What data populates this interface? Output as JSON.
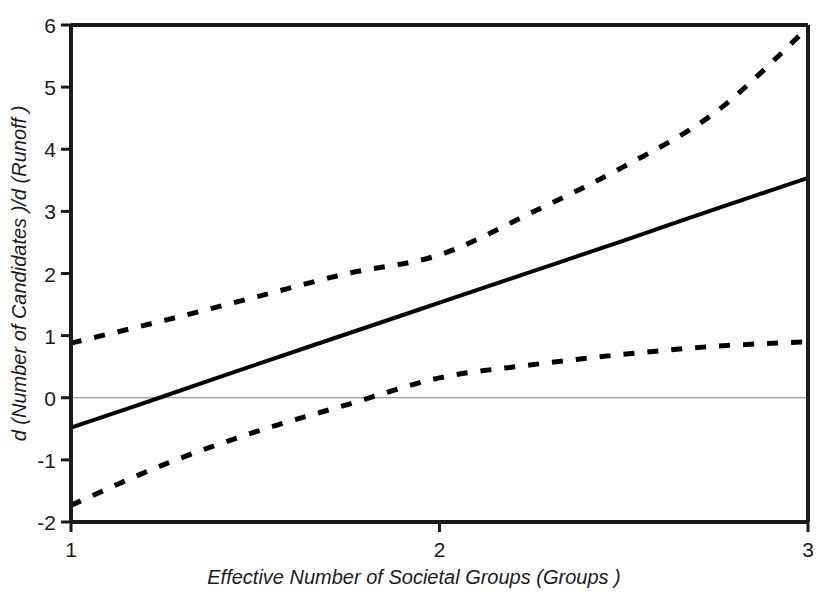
{
  "chart_data": {
    "type": "line",
    "title": "",
    "subtitle": "",
    "xlabel": "Effective Number of Societal Groups  (Groups )",
    "ylabel": "d (Number of Candidates )/d (Runoff )",
    "xlim": [
      1,
      3
    ],
    "ylim": [
      -2,
      6
    ],
    "xticks": [
      1,
      2,
      3
    ],
    "xtick_labels": [
      "1",
      "2",
      "3"
    ],
    "yticks": [
      -2,
      -1,
      0,
      1,
      2,
      3,
      4,
      5,
      6
    ],
    "ytick_labels": [
      "-2",
      "-1",
      "0",
      "1",
      "2",
      "3",
      "4",
      "5",
      "6"
    ],
    "grid": false,
    "legend": null,
    "reference_lines": [
      {
        "name": "zero-line",
        "orientation": "horizontal",
        "y": 0,
        "color": "#808080",
        "style": "solid",
        "width": 1
      }
    ],
    "series": [
      {
        "name": "Marginal Effect",
        "style": "solid",
        "color": "#000000",
        "width": 4,
        "x": [
          1.0,
          1.25,
          1.5,
          1.75,
          2.0,
          2.25,
          2.5,
          2.75,
          3.0
        ],
        "values": [
          -0.48,
          0.02,
          0.53,
          1.03,
          1.53,
          2.03,
          2.53,
          3.04,
          3.54
        ]
      },
      {
        "name": "Upper 95% Confidence Bound",
        "style": "dashed",
        "color": "#000000",
        "width": 5,
        "x": [
          1.0,
          1.25,
          1.5,
          1.75,
          2.0,
          2.25,
          2.5,
          2.75,
          3.0
        ],
        "values": [
          0.88,
          1.24,
          1.62,
          2.0,
          2.3,
          2.98,
          3.72,
          4.6,
          5.96
        ]
      },
      {
        "name": "Lower 95% Confidence Bound",
        "style": "dashed",
        "color": "#000000",
        "width": 5,
        "x": [
          1.0,
          1.25,
          1.5,
          1.75,
          2.0,
          2.25,
          2.5,
          2.75,
          3.0
        ],
        "values": [
          -1.73,
          -1.08,
          -0.55,
          -0.11,
          0.32,
          0.53,
          0.7,
          0.83,
          0.9
        ]
      }
    ],
    "annotations": []
  },
  "axes": {
    "y_title": "d (Number of Candidates )/d (Runoff )",
    "x_title": "Effective Number of Societal Groups  (Groups )"
  },
  "colors": {
    "frame": "#1a1a1a",
    "line": "#000000",
    "zero_reference": "#8c8c8c",
    "background": "#ffffff",
    "text": "#1a1a1a"
  }
}
